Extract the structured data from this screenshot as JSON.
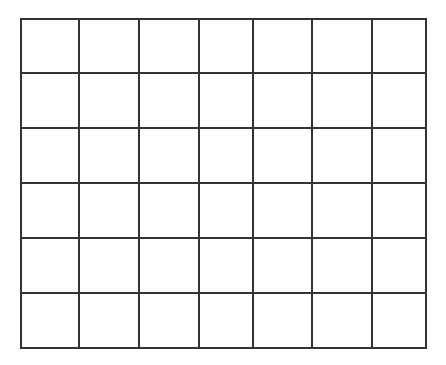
{
  "grid": {
    "rows": 6,
    "cols": 7,
    "line_color": "#333333",
    "background": "#ffffff",
    "col_lines": [
      21,
      79,
      139,
      199,
      253,
      312,
      372,
      426
    ],
    "row_lines": [
      19,
      73,
      128,
      183,
      238,
      293,
      348
    ]
  }
}
